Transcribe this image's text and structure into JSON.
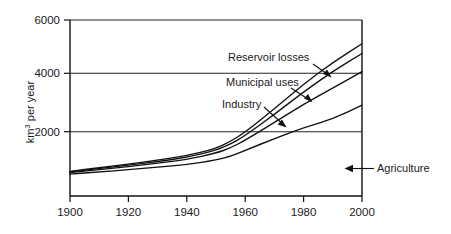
{
  "chart_data": {
    "type": "line",
    "title": "",
    "subtitle": "",
    "xlabel": "",
    "ylabel": "km³ per year",
    "ylabel_base": "km",
    "ylabel_sup": "3",
    "ylabel_rest": " per year",
    "xlim": [
      1900,
      2000
    ],
    "ylim": [
      0,
      6000
    ],
    "grid": "horizontal gridlines at 2000, 4000, 6000",
    "legend_position": "inline annotations with leader arrows",
    "xticks": [
      1900,
      1920,
      1940,
      1960,
      1980,
      2000
    ],
    "xtick_labels": [
      "1900",
      "1920",
      "1940",
      "1960",
      "1980",
      "2000"
    ],
    "yticks": [
      2000,
      4000,
      6000
    ],
    "ytick_labels": [
      "2000",
      "4000",
      "6000"
    ],
    "x": [
      1900,
      1910,
      1920,
      1930,
      1940,
      1950,
      1955,
      1960,
      1970,
      1980,
      1990,
      2000
    ],
    "series": [
      {
        "name": "Agriculture",
        "order": 1,
        "position": "bottom curve",
        "values": [
          480,
          560,
          640,
          730,
          820,
          980,
          1120,
          1330,
          1750,
          2150,
          2450,
          2950
        ]
      },
      {
        "name": "Industry",
        "order": 2,
        "position": "second curve",
        "values": [
          530,
          640,
          750,
          870,
          1000,
          1230,
          1420,
          1700,
          2330,
          2980,
          3560,
          4150
        ]
      },
      {
        "name": "Municipal uses",
        "order": 3,
        "position": "third curve",
        "values": [
          560,
          680,
          800,
          930,
          1080,
          1330,
          1560,
          1860,
          2620,
          3430,
          4160,
          4800
        ]
      },
      {
        "name": "Reservoir losses",
        "order": 4,
        "position": "top curve",
        "values": [
          580,
          710,
          840,
          980,
          1140,
          1400,
          1660,
          1980,
          2820,
          3700,
          4480,
          5150
        ]
      }
    ],
    "annotations": [
      {
        "id": "reservoir-losses",
        "label": "Reservoir losses",
        "points_to_series": "Reservoir losses",
        "arrow": "down-right"
      },
      {
        "id": "municipal-uses",
        "label": "Municipal uses",
        "points_to_series": "Municipal uses",
        "arrow": "down-right"
      },
      {
        "id": "industry",
        "label": "Industry",
        "points_to_series": "Industry",
        "arrow": "down-right"
      },
      {
        "id": "agriculture",
        "label": "Agriculture",
        "points_to_series": "Agriculture",
        "arrow": "left"
      }
    ],
    "colors": {
      "line": "#111111",
      "axis": "#111111",
      "grid": "#222222",
      "background": "#ffffff"
    }
  }
}
